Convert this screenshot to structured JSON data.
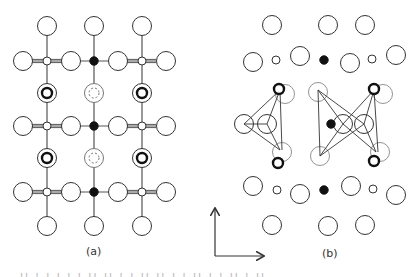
{
  "figure": {
    "colors": {
      "stroke": "#333333",
      "faint": "#777777",
      "bond": "#555555",
      "fill_black": "#111111",
      "background": "#ffffff"
    },
    "panel_a": {
      "label": "(a)",
      "label_pos": [
        94,
        252
      ],
      "bonds": [
        [
          47,
          26,
          47,
          226
        ],
        [
          94,
          26,
          94,
          226
        ],
        [
          142,
          26,
          142,
          226
        ],
        [
          23,
          61,
          166,
          61
        ],
        [
          23,
          126,
          166,
          126
        ],
        [
          23,
          192,
          166,
          192
        ]
      ],
      "double_bonds": [
        [
          32,
          61,
          70,
          61
        ],
        [
          118,
          61,
          156,
          61
        ],
        [
          32,
          126,
          70,
          126
        ],
        [
          118,
          126,
          156,
          126
        ],
        [
          32,
          192,
          70,
          192
        ],
        [
          118,
          192,
          156,
          192
        ]
      ],
      "large_atoms": [
        [
          47,
          26
        ],
        [
          94,
          26
        ],
        [
          142,
          26
        ],
        [
          23,
          61
        ],
        [
          71,
          61
        ],
        [
          118,
          61
        ],
        [
          166,
          61
        ],
        [
          23,
          126
        ],
        [
          71,
          126
        ],
        [
          118,
          126
        ],
        [
          166,
          126
        ],
        [
          23,
          192
        ],
        [
          71,
          192
        ],
        [
          118,
          192
        ],
        [
          166,
          192
        ],
        [
          47,
          226
        ],
        [
          94,
          226
        ],
        [
          142,
          226
        ]
      ],
      "small_white_atoms": [
        [
          47,
          61
        ],
        [
          142,
          61
        ],
        [
          47,
          126
        ],
        [
          142,
          126
        ],
        [
          47,
          192
        ],
        [
          142,
          192
        ]
      ],
      "small_black_atoms": [
        [
          94,
          61
        ],
        [
          94,
          126
        ],
        [
          94,
          192
        ]
      ],
      "bold_ring_atoms": [
        [
          47,
          93
        ],
        [
          142,
          93
        ],
        [
          47,
          158
        ],
        [
          142,
          158
        ]
      ],
      "dashed_ring_atoms": [
        [
          94,
          93
        ],
        [
          94,
          158
        ]
      ]
    },
    "panel_b": {
      "label": "(b)",
      "label_pos": [
        330,
        254
      ],
      "large_atoms": [
        [
          272,
          25
        ],
        [
          328,
          25
        ],
        [
          365,
          25
        ],
        [
          253,
          62
        ],
        [
          300,
          56
        ],
        [
          350,
          63
        ],
        [
          396,
          55
        ],
        [
          253,
          186
        ],
        [
          300,
          194
        ],
        [
          351,
          186
        ],
        [
          396,
          195
        ],
        [
          272,
          225
        ],
        [
          328,
          226
        ],
        [
          365,
          225
        ],
        [
          244,
          124
        ],
        [
          267,
          124
        ],
        [
          343,
          124
        ],
        [
          364,
          124
        ]
      ],
      "faint_atoms": [
        [
          285,
          94
        ],
        [
          282,
          152
        ],
        [
          318,
          92
        ],
        [
          320,
          156
        ],
        [
          383,
          94
        ],
        [
          380,
          152
        ]
      ],
      "small_white_atoms": [
        [
          276,
          60
        ],
        [
          372,
          59
        ],
        [
          277,
          190
        ],
        [
          373,
          189
        ]
      ],
      "small_black_atoms": [
        [
          324,
          60
        ],
        [
          331,
          124
        ],
        [
          324,
          190
        ]
      ],
      "bold_ring_atoms": [
        [
          279,
          89
        ],
        [
          278,
          163
        ],
        [
          374,
          89
        ],
        [
          374,
          161
        ]
      ],
      "lines": [
        [
          280,
          90,
          244,
          124
        ],
        [
          280,
          90,
          267,
          124
        ],
        [
          280,
          90,
          282,
          150
        ],
        [
          244,
          124,
          280,
          150
        ],
        [
          267,
          124,
          280,
          150
        ],
        [
          244,
          124,
          267,
          124
        ],
        [
          318,
          90,
          320,
          156
        ],
        [
          318,
          90,
          343,
          124
        ],
        [
          318,
          90,
          364,
          124
        ],
        [
          320,
          156,
          343,
          124
        ],
        [
          320,
          156,
          364,
          124
        ],
        [
          374,
          90,
          343,
          124
        ],
        [
          374,
          90,
          364,
          124
        ],
        [
          374,
          90,
          378,
          152
        ],
        [
          343,
          124,
          376,
          152
        ],
        [
          364,
          124,
          376,
          152
        ]
      ]
    },
    "axes": {
      "origin": [
        215,
        256
      ],
      "up_end": [
        215,
        209
      ],
      "right_end": [
        263,
        256
      ]
    },
    "caption_fragment": "ıı ı ı ı   ı ı ıı ıı ı  ı ıı ıı ı ı ıı ı ı ıı ı ıı"
  }
}
